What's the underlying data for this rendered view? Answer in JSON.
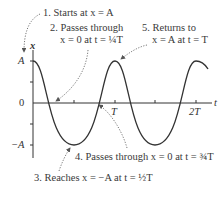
{
  "diagram": {
    "type": "simple-harmonic-motion-graph",
    "axes": {
      "y_label": "x",
      "x_label": "t",
      "y_ticks": [
        "A",
        "0",
        "−A"
      ],
      "x_ticks": [
        "T",
        "2T"
      ]
    },
    "annotations": [
      {
        "id": 1,
        "text": "1. Starts at x = A"
      },
      {
        "id": 2,
        "line1": "2. Passes through",
        "line2": "x = 0 at t = ¼T"
      },
      {
        "id": 3,
        "text": "3. Reaches x = −A at t = ½T"
      },
      {
        "id": 4,
        "text": "4. Passes through x = 0 at t = ¾T"
      },
      {
        "id": 5,
        "line1": "5. Returns to",
        "line2": "x = A at t = T"
      }
    ],
    "colors": {
      "curve": "#333333",
      "axis": "#333333",
      "arrow": "#555555",
      "text": "#3a3a3a"
    }
  }
}
